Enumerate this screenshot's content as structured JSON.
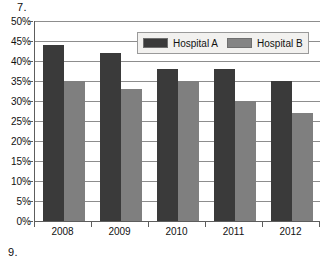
{
  "page": {
    "question_number_top": "7.",
    "question_number_bottom": "9."
  },
  "legend": {
    "entries": [
      {
        "label": "Hospital A",
        "color": "#3a3a3a"
      },
      {
        "label": "Hospital B",
        "color": "#848484"
      }
    ]
  },
  "chart_data": {
    "type": "bar",
    "title": "",
    "xlabel": "",
    "ylabel": "",
    "ylim": [
      0,
      50
    ],
    "ytick_labels": [
      "50%",
      "45%",
      "40%",
      "35%",
      "30%",
      "25%",
      "20%",
      "15%",
      "10%",
      "5%",
      "0%"
    ],
    "ytick_values": [
      50,
      45,
      40,
      35,
      30,
      25,
      20,
      15,
      10,
      5,
      0
    ],
    "grid": true,
    "legend_position": "top-center",
    "categories": [
      "2008",
      "2009",
      "2010",
      "2011",
      "2012"
    ],
    "series": [
      {
        "name": "Hospital A",
        "color": "#3a3a3a",
        "values": [
          44,
          42,
          38,
          38,
          35
        ]
      },
      {
        "name": "Hospital B",
        "color": "#7f7f7f",
        "values": [
          35,
          33,
          35,
          30,
          27
        ]
      }
    ]
  }
}
